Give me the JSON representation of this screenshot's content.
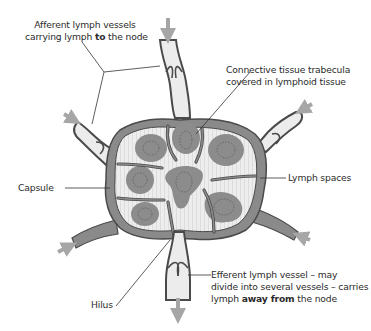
{
  "diagram": {
    "colors": {
      "capsule": "#8a8a8a",
      "capsule_outline": "#4a4a4a",
      "lymph_space": "#ececec",
      "cortex_fibres": "#dcdcdc",
      "follicle": "#8c8c8c",
      "germinal_center_dots": "#5a5a5a",
      "arrow": "#a6a6a6",
      "leader_line": "#333333",
      "text": "#2b2b2b"
    },
    "labels": {
      "afferent": {
        "line1": "Afferent lymph vessels",
        "line2_pre": "carrying lymph ",
        "line2_bold": "to",
        "line2_post": " the node"
      },
      "trabecula": {
        "line1": "Connective tissue trabecula",
        "line2": "covered in lymphoid tissue"
      },
      "lymph_spaces": "Lymph spaces",
      "capsule": "Capsule",
      "hilus": "Hilus",
      "efferent": {
        "line1": "Efferent lymph vessel – may",
        "line2": "divide into several vessels – carries",
        "line3_pre": "lymph ",
        "line3_bold": "away from",
        "line3_post": " the node"
      }
    }
  }
}
